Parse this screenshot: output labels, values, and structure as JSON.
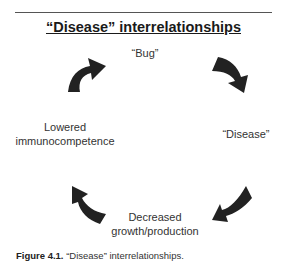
{
  "diagram": {
    "title": "“Disease” interrelationships",
    "nodes": [
      {
        "id": "bug",
        "label": "“Bug”"
      },
      {
        "id": "disease",
        "label": "“Disease”"
      },
      {
        "id": "growth",
        "label_line1": "Decreased",
        "label_line2": "growth/production"
      },
      {
        "id": "immuno",
        "label_line1": "Lowered",
        "label_line2": "immunocompetence"
      }
    ],
    "cycle_order": [
      "bug",
      "disease",
      "growth",
      "immuno"
    ],
    "arrows": [
      {
        "from": "bug",
        "to": "disease",
        "icon": "curved-arrow-down-right"
      },
      {
        "from": "disease",
        "to": "growth",
        "icon": "curved-arrow-down-left"
      },
      {
        "from": "growth",
        "to": "immuno",
        "icon": "curved-arrow-up-left"
      },
      {
        "from": "immuno",
        "to": "bug",
        "icon": "curved-arrow-up-right"
      }
    ],
    "arrow_color": "#222222"
  },
  "caption": {
    "label": "Figure 4.1.",
    "text": "“Disease” interrelationships."
  }
}
